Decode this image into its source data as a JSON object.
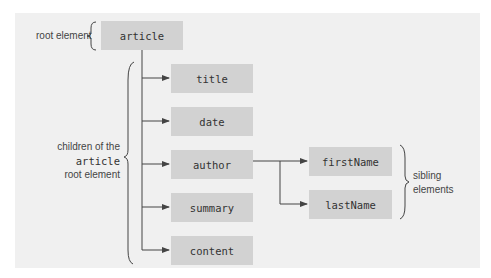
{
  "diagram": {
    "root": {
      "label": "article",
      "annotation": "root element"
    },
    "children": [
      {
        "label": "title"
      },
      {
        "label": "date"
      },
      {
        "label": "author"
      },
      {
        "label": "summary"
      },
      {
        "label": "content"
      }
    ],
    "grandchildren": [
      {
        "label": "firstName"
      },
      {
        "label": "lastName"
      }
    ],
    "children_annotation": {
      "line1": "children of the",
      "line2": "article",
      "line3": "root element"
    },
    "sibling_annotation": {
      "line1": "sibling",
      "line2": "elements"
    },
    "colors": {
      "panel": "#f0f0f0",
      "box": "#d2d2d2",
      "line": "#444444"
    }
  }
}
